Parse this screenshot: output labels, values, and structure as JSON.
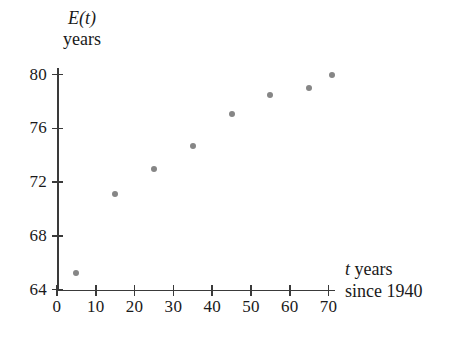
{
  "chart_data": {
    "type": "scatter",
    "title": "",
    "xlabel": "t years since 1940",
    "ylabel": "E(t) years",
    "xlim": [
      0,
      71.5
    ],
    "ylim": [
      64,
      81.5
    ],
    "grid": false,
    "legend": "none",
    "x": [
      5,
      15,
      25,
      35,
      45,
      55,
      65,
      71
    ],
    "values": [
      65.2,
      71.1,
      73.0,
      74.7,
      77.1,
      78.5,
      79.0,
      80.0
    ],
    "points": [
      {
        "x": 5,
        "y": 65.2
      },
      {
        "x": 15,
        "y": 71.1
      },
      {
        "x": 25,
        "y": 73.0
      },
      {
        "x": 35,
        "y": 74.7
      },
      {
        "x": 45,
        "y": 77.1
      },
      {
        "x": 55,
        "y": 78.5
      },
      {
        "x": 65,
        "y": 79.0
      },
      {
        "x": 71,
        "y": 80.0
      }
    ],
    "xticks": [
      0,
      10,
      20,
      30,
      40,
      50,
      60,
      70
    ],
    "xtick_labels": [
      "0",
      "10",
      "20",
      "30",
      "40",
      "50",
      "60",
      "70"
    ],
    "yticks": [
      64,
      68,
      72,
      76,
      80
    ],
    "ytick_labels": [
      "64",
      "68",
      "72",
      "76",
      "80"
    ],
    "point_color": "#868686",
    "axis_color": "#3a3a3a"
  },
  "axis_titles": {
    "y_variable": "E(t)",
    "y_unit": "years",
    "x_variable": "t",
    "x_unit": "years",
    "x_line2": "since 1940"
  }
}
